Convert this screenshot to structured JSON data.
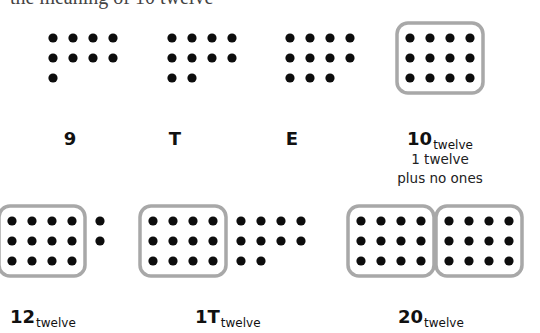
{
  "top_text": "the meaning of 10 twelve",
  "colors": {
    "dot": "#0d0d0d",
    "box_stroke": "#a8a8a8",
    "background": "#ffffff"
  },
  "groups": [
    {
      "id": "nine",
      "total": 9,
      "twelves": 0,
      "ones": 9,
      "label": {
        "main": "9",
        "sub": ""
      }
    },
    {
      "id": "ten",
      "total": 10,
      "twelves": 0,
      "ones": 10,
      "label": {
        "main": "T",
        "sub": ""
      }
    },
    {
      "id": "eleven",
      "total": 11,
      "twelves": 0,
      "ones": 11,
      "label": {
        "main": "E",
        "sub": ""
      }
    },
    {
      "id": "twelve",
      "total": 12,
      "twelves": 1,
      "ones": 0,
      "label": {
        "main": "10",
        "sub": "twelve"
      },
      "caption": [
        "1 twelve",
        "plus no ones"
      ]
    },
    {
      "id": "fourteen",
      "total": 14,
      "twelves": 1,
      "ones": 2,
      "label": {
        "main": "12",
        "sub": "twelve"
      }
    },
    {
      "id": "twentytwo",
      "total": 22,
      "twelves": 1,
      "ones": 10,
      "label": {
        "main": "1T",
        "sub": "twelve"
      }
    },
    {
      "id": "twentyfour",
      "total": 24,
      "twelves": 2,
      "ones": 0,
      "label": {
        "main": "20",
        "sub": "twelve"
      }
    }
  ]
}
